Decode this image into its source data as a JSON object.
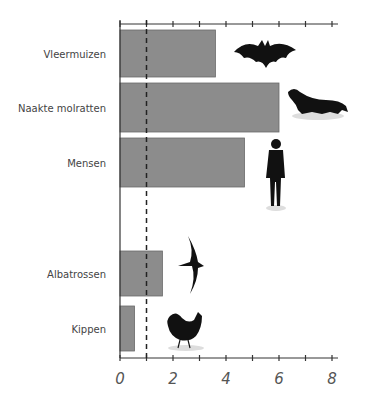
{
  "chart_data": {
    "type": "bar",
    "orientation": "horizontal",
    "title": "",
    "xlabel": "",
    "ylabel": "",
    "categories": [
      "Vleermuizen",
      "Naakte molratten",
      "Mensen",
      "Albatrossen",
      "Kippen"
    ],
    "values": [
      3.6,
      6.0,
      4.7,
      1.6,
      0.55
    ],
    "xlim": [
      0,
      8
    ],
    "x_ticks": [
      "0",
      "2",
      "4",
      "6",
      "8"
    ],
    "reference_line": {
      "x": 1,
      "style": "dashed"
    },
    "icons": [
      "bat-icon",
      "naked-mole-rat-icon",
      "human-icon",
      "albatross-icon",
      "chicken-icon"
    ],
    "bar_color": "#8c8c8c",
    "grid": false
  }
}
